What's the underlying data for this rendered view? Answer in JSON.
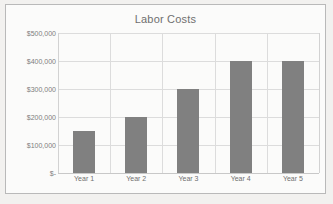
{
  "chart_data": {
    "type": "bar",
    "title": "Labor Costs",
    "xlabel": "",
    "ylabel": "",
    "categories": [
      "Year 1",
      "Year 2",
      "Year 3",
      "Year 4",
      "Year 5"
    ],
    "values": [
      150000,
      200000,
      300000,
      400000,
      400000
    ],
    "ylim": [
      0,
      500000
    ],
    "ytick_values": [
      500000,
      400000,
      300000,
      200000,
      100000,
      0
    ],
    "ytick_labels": [
      "$500,000",
      "$400,000",
      "$300,000",
      "$200,000",
      "$100,000",
      "$-"
    ],
    "grid": true,
    "legend": false,
    "bar_color": "#808080",
    "gridline_color": "#dcdcdc",
    "text_color": "#6f6f6f",
    "plot_background": "#fbfbfa"
  }
}
